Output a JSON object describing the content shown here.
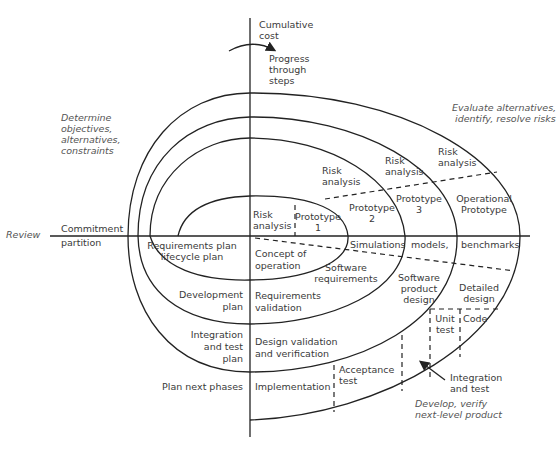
{
  "axes": {
    "vertical_label": [
      "Cumulative",
      "cost"
    ],
    "progress_label": [
      "Progress",
      "through",
      "steps"
    ],
    "left_top": [
      "Commitment"
    ],
    "left_bottom": [
      "partition"
    ],
    "review": "Review"
  },
  "quadrants": {
    "top_left": [
      "Determine",
      "objectives,",
      "alternatives,",
      "constraints"
    ],
    "top_right": [
      "Evaluate alternatives,",
      "identify, resolve risks"
    ],
    "bottom_right": [
      "Develop, verify",
      "next-level product"
    ]
  },
  "risk_analysis": [
    [
      "Risk",
      "analysis"
    ],
    [
      "Risk",
      "analysis"
    ],
    [
      "Risk",
      "analysis"
    ],
    [
      "Risk",
      "analysis"
    ]
  ],
  "prototypes": [
    [
      "Prototype",
      "1"
    ],
    [
      "Prototype",
      "2"
    ],
    [
      "Prototype",
      "3"
    ],
    [
      "Operational",
      "Prototype"
    ]
  ],
  "simulations": [
    "Simulations",
    "models,",
    "benchmarks"
  ],
  "plans": [
    [
      "Requirements plan",
      "lifecycle plan"
    ],
    [
      "Development",
      "plan"
    ],
    [
      "Integration",
      "and test",
      "plan"
    ],
    [
      "Plan next phases"
    ]
  ],
  "development": [
    [
      "Concept of",
      "operation"
    ],
    [
      "Software",
      "requirements"
    ],
    [
      "Software",
      "product",
      "design"
    ],
    [
      "Detailed",
      "design"
    ],
    [
      "Code"
    ],
    [
      "Unit",
      "test"
    ],
    [
      "Integration",
      "and test"
    ],
    [
      "Acceptance",
      "test"
    ],
    [
      "Implementation"
    ]
  ],
  "validation": [
    [
      "Requirements",
      "validation"
    ],
    [
      "Design validation",
      "and verification"
    ]
  ]
}
